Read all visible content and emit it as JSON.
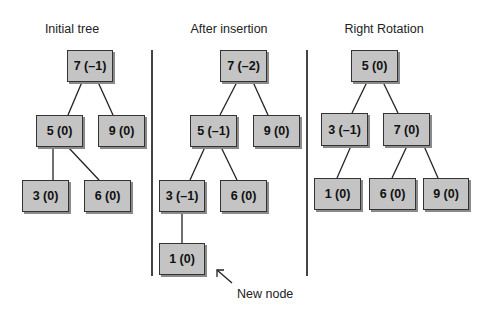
{
  "panels": [
    {
      "title": "Initial tree",
      "title_pos": [
        72,
        22
      ],
      "nodes": [
        {
          "id": "7",
          "label": "7 (–1)",
          "box": [
            67,
            50,
            46,
            32
          ]
        },
        {
          "id": "5",
          "label": "5 (0)",
          "box": [
            36,
            115,
            47,
            32
          ]
        },
        {
          "id": "9",
          "label": "9 (0)",
          "box": [
            98,
            115,
            47,
            32
          ]
        },
        {
          "id": "3",
          "label": "3 (0)",
          "box": [
            22,
            180,
            47,
            32
          ]
        },
        {
          "id": "6",
          "label": "6 (0)",
          "box": [
            84,
            180,
            47,
            32
          ]
        }
      ],
      "edges": [
        [
          82,
          82,
          68,
          115
        ],
        [
          98,
          82,
          113,
          115
        ],
        [
          53,
          147,
          53,
          180
        ],
        [
          68,
          147,
          99,
          180
        ]
      ]
    },
    {
      "title": "After insertion",
      "title_pos": [
        229,
        22
      ],
      "nodes": [
        {
          "id": "7",
          "label": "7 (–2)",
          "box": [
            220,
            50,
            47,
            32
          ]
        },
        {
          "id": "5",
          "label": "5 (–1)",
          "box": [
            190,
            115,
            47,
            32
          ]
        },
        {
          "id": "9",
          "label": "9 (0)",
          "box": [
            253,
            115,
            47,
            32
          ]
        },
        {
          "id": "3",
          "label": "3 (–1)",
          "box": [
            159,
            180,
            46,
            32
          ]
        },
        {
          "id": "6",
          "label": "6 (0)",
          "box": [
            220,
            180,
            47,
            32
          ]
        },
        {
          "id": "1",
          "label": "1 (0)",
          "box": [
            159,
            243,
            46,
            32
          ]
        }
      ],
      "edges": [
        [
          237,
          82,
          220,
          115
        ],
        [
          253,
          82,
          268,
          115
        ],
        [
          205,
          147,
          190,
          180
        ],
        [
          221,
          147,
          237,
          180
        ],
        [
          182,
          212,
          182,
          243
        ]
      ]
    },
    {
      "title": "Right Rotation",
      "title_pos": [
        384,
        22
      ],
      "nodes": [
        {
          "id": "5",
          "label": "5 (0)",
          "box": [
            351,
            50,
            47,
            32
          ]
        },
        {
          "id": "3",
          "label": "3 (–1)",
          "box": [
            321,
            113,
            47,
            33
          ]
        },
        {
          "id": "7",
          "label": "7 (0)",
          "box": [
            383,
            113,
            47,
            33
          ]
        },
        {
          "id": "1",
          "label": "1 (0)",
          "box": [
            314,
            178,
            47,
            32
          ]
        },
        {
          "id": "6",
          "label": "6 (0)",
          "box": [
            369,
            178,
            47,
            32
          ]
        },
        {
          "id": "9",
          "label": "9 (0)",
          "box": [
            423,
            178,
            46,
            32
          ]
        }
      ],
      "edges": [
        [
          367,
          82,
          352,
          113
        ],
        [
          383,
          82,
          398,
          113
        ],
        [
          351,
          146,
          337,
          178
        ],
        [
          407,
          146,
          392,
          178
        ],
        [
          424,
          146,
          438,
          178
        ]
      ]
    }
  ],
  "dividers": [
    {
      "x": 151,
      "y1": 50,
      "y2": 276
    },
    {
      "x": 306,
      "y1": 50,
      "y2": 276
    }
  ],
  "annotation": {
    "label": "New node",
    "label_pos": [
      237,
      287
    ],
    "arrow": [
      232,
      283,
      217,
      270
    ]
  },
  "colors": {
    "node_fill": "#c4c4c4",
    "node_border": "#333333",
    "node_shadow": "#8a8a8a",
    "line": "#222222"
  }
}
